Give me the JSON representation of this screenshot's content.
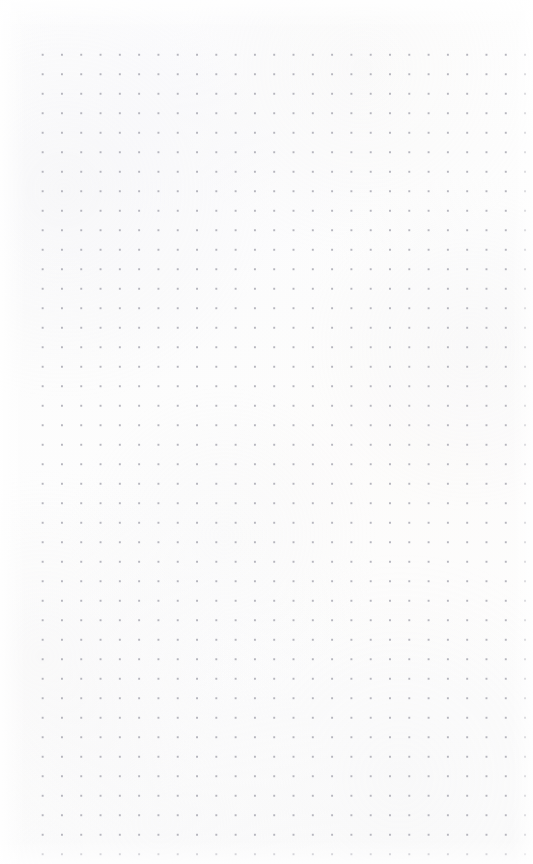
{
  "page": {
    "kind": "dot-grid-paper",
    "width_px": 533,
    "height_px": 864,
    "background_color": "#fdfdfd",
    "content_text": ""
  },
  "grid": {
    "dot_color": "#b5b5bd",
    "dot_size_px": 2,
    "spacing_x_px": 19.3,
    "spacing_y_px": 19.5,
    "origin_x_px": 33,
    "origin_y_px": 45,
    "columns": 26,
    "rows": 42,
    "margin_left_px": 33,
    "margin_right_px": 18,
    "margin_top_px": 45,
    "margin_bottom_px": 19
  }
}
